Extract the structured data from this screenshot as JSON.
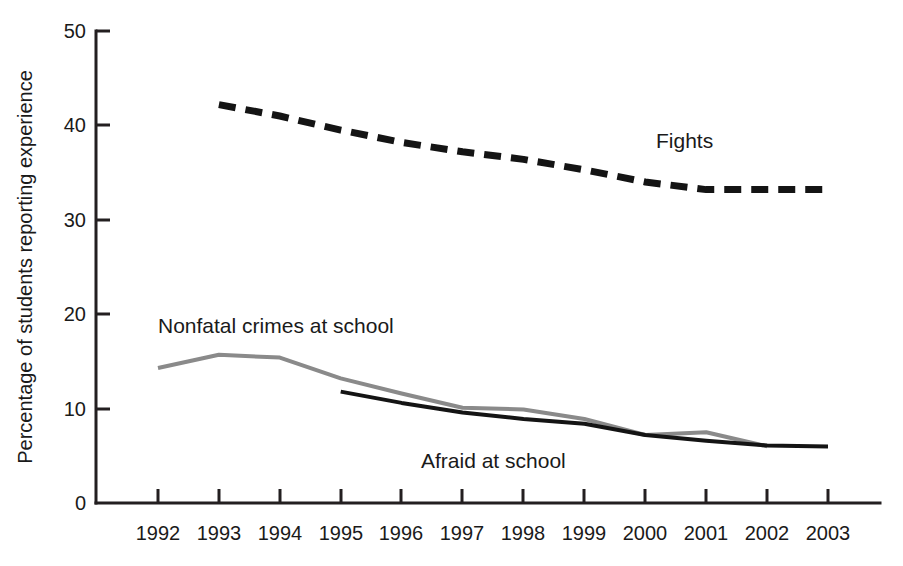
{
  "chart_data": {
    "type": "line",
    "title": "",
    "subtitle": "",
    "xlabel": "",
    "ylabel": "Percentage of students reporting experience",
    "categories": [
      "1992",
      "1993",
      "1994",
      "1995",
      "1996",
      "1997",
      "1998",
      "1999",
      "2000",
      "2001",
      "2002",
      "2003"
    ],
    "x": [
      1992,
      1993,
      1994,
      1995,
      1996,
      1997,
      1998,
      1999,
      2000,
      2001,
      2002,
      2003
    ],
    "xlim": [
      1992,
      2003
    ],
    "ylim": [
      0,
      50
    ],
    "yticks": [
      0,
      10,
      20,
      30,
      40,
      50
    ],
    "ytick_labels": [
      "0",
      "10",
      "20",
      "30",
      "40",
      "50"
    ],
    "grid": false,
    "legend_position": "inline-annotations",
    "series": [
      {
        "name": "Fights",
        "style": "dashed",
        "color": "#141414",
        "x": [
          1993,
          1994,
          1995,
          1996,
          1997,
          1998,
          1999,
          2000,
          2001,
          2002,
          2003
        ],
        "values": [
          42.2,
          41.0,
          39.5,
          38.2,
          37.2,
          36.4,
          35.3,
          34.0,
          33.2,
          33.2,
          33.2
        ]
      },
      {
        "name": "Nonfatal crimes at school",
        "style": "solid",
        "color": "#8a8a8a",
        "x": [
          1992,
          1993,
          1994,
          1995,
          1996,
          1997,
          1998,
          1999,
          2000,
          2001,
          2002
        ],
        "values": [
          14.3,
          15.7,
          15.4,
          13.2,
          11.6,
          10.1,
          9.9,
          8.9,
          7.2,
          7.5,
          6.0
        ]
      },
      {
        "name": "Afraid at school",
        "style": "solid",
        "color": "#141414",
        "x": [
          1995,
          1996,
          1997,
          1998,
          1999,
          2000,
          2001,
          2002,
          2003
        ],
        "values": [
          11.8,
          10.6,
          9.6,
          8.9,
          8.4,
          7.2,
          6.6,
          6.1,
          6.0
        ]
      }
    ],
    "annotations": [
      {
        "text": "Fights",
        "x": 2000.4,
        "y": 38.5
      },
      {
        "text": "Nonfatal crimes at school",
        "x": 1992.1,
        "y": 19.2
      },
      {
        "text": "Afraid at school",
        "x": 1996.9,
        "y": 4.2
      }
    ]
  },
  "axis": {
    "y_title": "Percentage of students reporting experience",
    "y_ticks": [
      "50",
      "40",
      "30",
      "20",
      "10",
      "0"
    ],
    "x_ticks": [
      "1992",
      "1993",
      "1994",
      "1995",
      "1996",
      "1997",
      "1998",
      "1999",
      "2000",
      "2001",
      "2002",
      "2003"
    ]
  },
  "annotations": {
    "fights": "Fights",
    "nonfatal": "Nonfatal crimes at school",
    "afraid": "Afraid at school"
  },
  "colors": {
    "axis": "#231f20",
    "fights": "#141414",
    "nonfatal": "#8a8a8a",
    "afraid": "#141414",
    "background": "#ffffff"
  }
}
